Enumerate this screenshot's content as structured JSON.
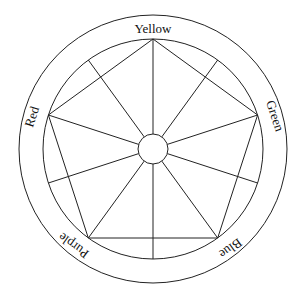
{
  "diagram": {
    "type": "color-wheel-pentagon",
    "labels": {
      "yellow": "Yellow",
      "green": "Green",
      "blue": "Blue",
      "purple": "Purple",
      "red": "Red"
    },
    "vertices": [
      "Yellow",
      "Green",
      "Blue",
      "Purple",
      "Red"
    ],
    "stroke_color": "#222222",
    "background": "#ffffff"
  }
}
